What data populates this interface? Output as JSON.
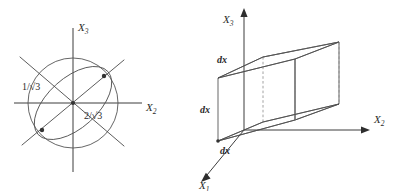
{
  "figure": {
    "domain_type": "diagram",
    "background_color": "#ffffff",
    "ink_color": "#4a4a4a",
    "panels": [
      {
        "id": "left",
        "name": "cross-section-circle-ellipse",
        "axes": {
          "horizontal_label": "X",
          "horizontal_subscript": "2",
          "vertical_label": "X",
          "vertical_subscript": "3"
        },
        "annotations": [
          {
            "id": "upper-left",
            "text": "1/√3"
          },
          {
            "id": "lower-right",
            "text": "2/√3"
          }
        ],
        "shapes": [
          "circle",
          "tilted-ellipse",
          "diagonal-line-positive",
          "diagonal-line-negative",
          "axis-horizontal",
          "axis-vertical"
        ],
        "marked_points": 2
      },
      {
        "id": "right",
        "name": "differential-volume-element",
        "axes": {
          "x1_label": "X",
          "x1_subscript": "1",
          "x2_label": "X",
          "x2_subscript": "2",
          "x3_label": "X",
          "x3_subscript": "3"
        },
        "edge_labels": [
          {
            "id": "top-edge",
            "text": "dx"
          },
          {
            "id": "left-edge",
            "text": "dx"
          },
          {
            "id": "bottom-edge",
            "text": "dx"
          }
        ],
        "shapes": [
          "parallelepiped-visible-edges",
          "parallelepiped-hidden-edges-dashed",
          "axis-x1-arrow",
          "axis-x2-arrow",
          "axis-x3-arrow"
        ]
      }
    ]
  }
}
